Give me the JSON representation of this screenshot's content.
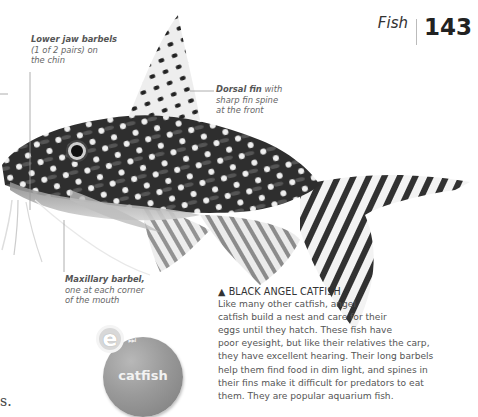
{
  "header": {
    "section": "Fish",
    "page_number": "143"
  },
  "annotations": {
    "lower_jaw": {
      "term": "Lower jaw barbels",
      "rest_lines": [
        "(1 of 2 pairs) on",
        "the chin"
      ]
    },
    "dorsal": {
      "term": "Dorsal fin",
      "rest_first": " with",
      "rest_lines": [
        "sharp fin spine",
        "at the front"
      ]
    },
    "maxillary": {
      "term": "Maxillary barbel,",
      "rest_lines": [
        "one at each corner",
        "of the mouth"
      ]
    }
  },
  "caption": {
    "marker": "▲",
    "title": "BLACK ANGEL CATFISH",
    "lines": [
      "Like many other catfish, angel",
      "catfish build a nest and care for their",
      "eggs until they hatch. These fish have",
      "poor eyesight, but like their relatives the carp,",
      "they have excellent hearing. Their long barbels",
      "help them find food in dim light, and spines in",
      "their fins make it difficult for predators to eat",
      "them. They are popular aquarium fish."
    ]
  },
  "elink": {
    "letter": "e",
    "arrow_glyph": "⏭",
    "keyword": "catfish"
  },
  "cut_off_text": "s.",
  "image": {
    "subject": "black angel catfish photograph",
    "colors": {
      "body_dark": "#2a2a2a",
      "spot": "#f2f2f2",
      "belly": "#bdbdbd",
      "leader_line": "#999999"
    }
  }
}
